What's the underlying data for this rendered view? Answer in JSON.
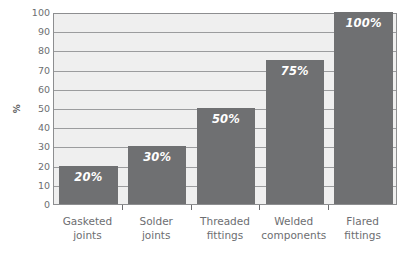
{
  "chart_data": {
    "type": "bar",
    "title": "",
    "xlabel": "",
    "ylabel": "%",
    "ylim": [
      0,
      100
    ],
    "grid": true,
    "legend": "none",
    "categories": [
      "Gasketed joints",
      "Solder joints",
      "Threaded fittings",
      "Welded components",
      "Flared fittings"
    ],
    "category_lines": [
      [
        "Gasketed",
        "joints"
      ],
      [
        "Solder",
        "joints"
      ],
      [
        "Threaded",
        "fittings"
      ],
      [
        "Welded",
        "components"
      ],
      [
        "Flared",
        "fittings"
      ]
    ],
    "values": [
      20,
      30,
      50,
      75,
      100
    ],
    "value_labels": [
      "20%",
      "30%",
      "50%",
      "75%",
      "100%"
    ],
    "y_ticks": [
      0,
      10,
      20,
      30,
      40,
      50,
      60,
      70,
      80,
      90,
      100
    ],
    "y_tick_labels": [
      "0",
      "10",
      "20",
      "30",
      "40",
      "50",
      "60",
      "70",
      "80",
      "90",
      "100"
    ],
    "colors": {
      "bar_fill": "#6f7072",
      "plot_background": "#efefef",
      "gridline": "#9b9c9e",
      "axis_border": "#8d8e90",
      "tick_text": "#6d6e71",
      "value_label_text": "#ffffff",
      "page_background": "#ffffff"
    }
  }
}
